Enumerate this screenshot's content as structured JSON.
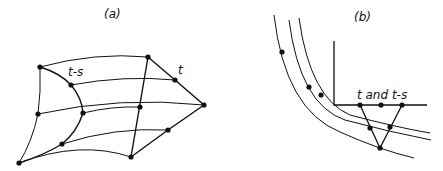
{
  "panels": {
    "a": {
      "title": "(a)",
      "labels": {
        "t_minus_s": "t-s",
        "t": "t"
      }
    },
    "b": {
      "title": "(b)",
      "labels": {
        "axis_text": "t and t-s"
      }
    }
  },
  "colors": {
    "ink": "#111111",
    "background": "#ffffff"
  }
}
